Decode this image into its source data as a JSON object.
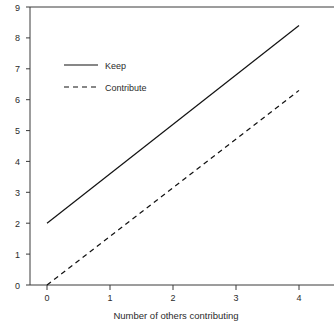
{
  "chart_data": {
    "type": "line",
    "title": "",
    "subtitle": "",
    "xlabel": "Number of others contributing",
    "ylabel": "",
    "xlim": [
      0,
      4
    ],
    "ylim": [
      0,
      9
    ],
    "x": [
      0,
      1,
      2,
      3,
      4
    ],
    "xticks": [
      "0",
      "1",
      "2",
      "3",
      "4"
    ],
    "yticks": [
      "0",
      "1",
      "2",
      "3",
      "4",
      "5",
      "6",
      "7",
      "8",
      "9"
    ],
    "grid": false,
    "legend_position": "upper-left-inside",
    "series": [
      {
        "name": "Keep",
        "style": "solid",
        "color": "#111111",
        "x": [
          0,
          4
        ],
        "values": [
          2.0,
          8.4
        ]
      },
      {
        "name": "Contribute",
        "style": "dashed",
        "color": "#111111",
        "x": [
          0,
          4
        ],
        "values": [
          0.0,
          6.3
        ]
      }
    ],
    "annotations": []
  },
  "legend": {
    "entries": [
      {
        "label": "Keep"
      },
      {
        "label": "Contribute"
      }
    ]
  },
  "axes": {
    "x_title": "Number of others contributing",
    "y_title": ""
  }
}
